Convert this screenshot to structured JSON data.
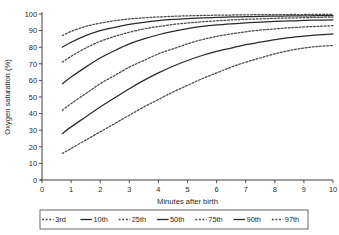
{
  "chart_data": {
    "type": "line",
    "title": "",
    "xlabel": "Minutes after birth",
    "ylabel": "Oxygen saturation (%)",
    "xlim": [
      0,
      10
    ],
    "ylim": [
      0,
      100
    ],
    "xticks": [
      0,
      1,
      2,
      3,
      4,
      5,
      6,
      7,
      8,
      9,
      10
    ],
    "yticks": [
      0,
      10,
      20,
      30,
      40,
      50,
      60,
      70,
      80,
      90,
      100
    ],
    "grid": false,
    "legend_position": "below",
    "x": [
      0.7,
      1,
      1.5,
      2,
      2.5,
      3,
      3.5,
      4,
      4.5,
      5,
      5.5,
      6,
      6.5,
      7,
      7.5,
      8,
      8.5,
      9,
      9.5,
      10
    ],
    "series": [
      {
        "name": "3rd",
        "style": "dashed",
        "values": [
          16,
          19,
          24,
          29,
          34,
          39,
          44,
          48.5,
          53,
          57,
          61,
          64.5,
          68,
          71,
          73.5,
          76,
          78,
          79.5,
          80.5,
          81
        ]
      },
      {
        "name": "10th",
        "style": "solid",
        "values": [
          28,
          32,
          38,
          44,
          49.5,
          55,
          60,
          64.5,
          68.5,
          72,
          75,
          77.5,
          79.5,
          81.5,
          83,
          84.5,
          85.8,
          86.7,
          87.4,
          88
        ]
      },
      {
        "name": "25th",
        "style": "dashed",
        "values": [
          42,
          46,
          52,
          58,
          63,
          68,
          72,
          76,
          79,
          82,
          84.5,
          86.5,
          88,
          89.3,
          90.3,
          91,
          91.7,
          92.2,
          92.6,
          93
        ]
      },
      {
        "name": "50th",
        "style": "solid",
        "values": [
          58,
          62,
          68,
          73.5,
          78,
          82,
          85,
          87.5,
          89.5,
          91.2,
          92.5,
          93.4,
          94.1,
          94.7,
          95.1,
          95.5,
          95.8,
          96.1,
          96.3,
          96.5
        ]
      },
      {
        "name": "75th",
        "style": "dashed",
        "values": [
          71,
          74.5,
          79.5,
          83.5,
          86.5,
          89,
          91,
          92.5,
          93.7,
          94.6,
          95.3,
          95.9,
          96.4,
          96.8,
          97.1,
          97.4,
          97.6,
          97.8,
          98,
          98.1
        ]
      },
      {
        "name": "90th",
        "style": "solid",
        "values": [
          80,
          83,
          87,
          90,
          92,
          93.7,
          95,
          96,
          96.7,
          97.2,
          97.6,
          97.9,
          98.2,
          98.4,
          98.6,
          98.7,
          98.8,
          98.9,
          99,
          99
        ]
      },
      {
        "name": "97th",
        "style": "dashed",
        "values": [
          87,
          89.5,
          92.5,
          94.5,
          96,
          97,
          97.7,
          98.2,
          98.6,
          98.9,
          99.1,
          99.3,
          99.4,
          99.5,
          99.6,
          99.6,
          99.7,
          99.7,
          99.8,
          99.8
        ]
      }
    ]
  },
  "legend": {
    "items": [
      {
        "label": "3rd",
        "style": "dashed"
      },
      {
        "label": "10th",
        "style": "solid"
      },
      {
        "label": "25th",
        "style": "dashed"
      },
      {
        "label": "50th",
        "style": "solid"
      },
      {
        "label": "75th",
        "style": "dashed"
      },
      {
        "label": "90th",
        "style": "solid"
      },
      {
        "label": "97th",
        "style": "dashed"
      }
    ]
  }
}
